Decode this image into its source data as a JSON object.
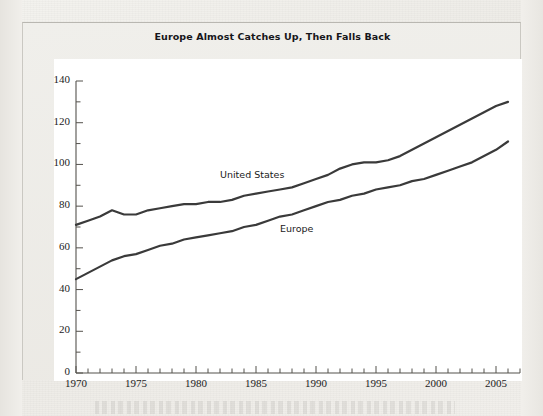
{
  "figure": {
    "title": "Europe Almost Catches Up, Then Falls Back",
    "caption_partial": ""
  },
  "chart_data": {
    "type": "line",
    "title": "Europe Almost Catches Up, Then Falls Back",
    "xlabel": "",
    "ylabel": "",
    "xlim": [
      1970,
      2007
    ],
    "ylim": [
      0,
      140
    ],
    "ytick_major_step": 20,
    "ytick_minor_step": 10,
    "xtick_major_step": 5,
    "xtick_minor_step": 1,
    "grid": false,
    "legend_position": "inline-annotation",
    "ytick_labels": [
      "0",
      "20",
      "40",
      "60",
      "80",
      "100",
      "120",
      "140"
    ],
    "ytick_values": [
      0,
      20,
      40,
      60,
      80,
      100,
      120,
      140
    ],
    "xtick_labels": [
      "1970",
      "1975",
      "1980",
      "1985",
      "1990",
      "1995",
      "2000",
      "2005"
    ],
    "xtick_values": [
      1970,
      1975,
      1980,
      1985,
      1990,
      1995,
      2000,
      2005
    ],
    "x": [
      1970,
      1971,
      1972,
      1973,
      1974,
      1975,
      1976,
      1977,
      1978,
      1979,
      1980,
      1981,
      1982,
      1983,
      1984,
      1985,
      1986,
      1987,
      1988,
      1989,
      1990,
      1991,
      1992,
      1993,
      1994,
      1995,
      1996,
      1997,
      1998,
      1999,
      2000,
      2001,
      2002,
      2003,
      2004,
      2005,
      2006
    ],
    "series": [
      {
        "name": "United States",
        "label": "United States",
        "color": "#3a3a3a",
        "label_x": 1982,
        "label_y": 95,
        "values": [
          71,
          73,
          75,
          78,
          76,
          76,
          78,
          79,
          80,
          81,
          81,
          82,
          82,
          83,
          85,
          86,
          87,
          88,
          89,
          91,
          93,
          95,
          98,
          100,
          101,
          101,
          102,
          104,
          107,
          110,
          113,
          116,
          119,
          122,
          125,
          128,
          130
        ]
      },
      {
        "name": "Europe",
        "label": "Europe",
        "color": "#3a3a3a",
        "label_x": 1987,
        "label_y": 69,
        "values": [
          45,
          48,
          51,
          54,
          56,
          57,
          59,
          61,
          62,
          64,
          65,
          66,
          67,
          68,
          70,
          71,
          73,
          75,
          76,
          78,
          80,
          82,
          83,
          85,
          86,
          88,
          89,
          90,
          92,
          93,
          95,
          97,
          99,
          101,
          104,
          107,
          111
        ]
      }
    ]
  }
}
